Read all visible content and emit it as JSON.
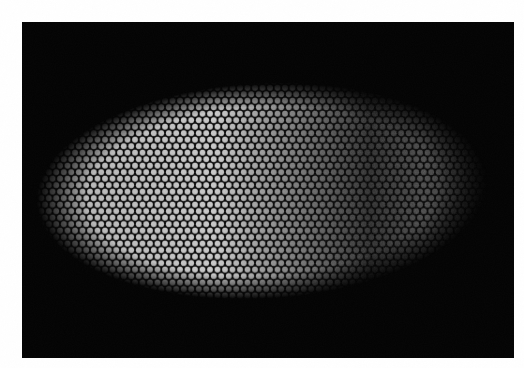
{
  "image": {
    "kind": "fluorescence-micrograph",
    "subject": "embryo with stained nuclei",
    "page_background": "#ffffff",
    "frame": {
      "x": 22,
      "y": 22,
      "width": 492,
      "height": 336,
      "color": "#030303"
    },
    "embryo": {
      "cx": 262,
      "cy": 191,
      "rx": 226,
      "ry": 108,
      "rotation_deg": -3,
      "intensity_stops": [
        {
          "offset": 0.0,
          "color": "#9a9a9a"
        },
        {
          "offset": 0.12,
          "color": "#b8b8b8"
        },
        {
          "offset": 0.4,
          "color": "#c9c9c9"
        },
        {
          "offset": 0.48,
          "color": "#a4a4a4"
        },
        {
          "offset": 0.6,
          "color": "#6e6e6e"
        },
        {
          "offset": 0.74,
          "color": "#2e2e2e"
        },
        {
          "offset": 0.86,
          "color": "#4a4a4a"
        },
        {
          "offset": 1.0,
          "color": "#1a1a1a"
        }
      ],
      "nucleus_spacing_px": 7.5,
      "nucleus_radius_px": 2.9
    }
  }
}
